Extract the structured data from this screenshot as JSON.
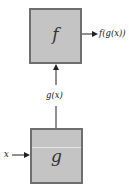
{
  "diagram": {
    "type": "function-composition",
    "boxes": [
      {
        "id": "f",
        "label": "f"
      },
      {
        "id": "g",
        "label": "g"
      }
    ],
    "labels": {
      "input": "x",
      "intermediate": "g(x)",
      "output": "f(g(x))"
    },
    "edges": [
      {
        "from": "x",
        "to": "g"
      },
      {
        "from": "g",
        "to": "f",
        "label": "g(x)"
      },
      {
        "from": "f",
        "to": "output",
        "label": "f(g(x))"
      }
    ],
    "colors": {
      "box_fill": "#c4c4c4",
      "box_border": "#6e6e6e",
      "arrow": "#222222"
    }
  }
}
